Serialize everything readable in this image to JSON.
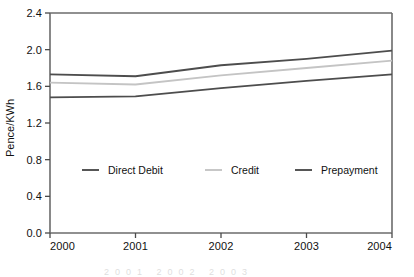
{
  "chart_data": {
    "type": "line",
    "title": "",
    "subtitle": "",
    "xlabel": "",
    "ylabel": "Pence/KWh",
    "x": [
      "2000",
      "2001",
      "2002",
      "2003",
      "2004"
    ],
    "categories": [
      "2000",
      "2001",
      "2002",
      "2003",
      "2004"
    ],
    "xlim": [
      2000,
      2004
    ],
    "ylim": [
      0.0,
      2.4
    ],
    "yticks": [
      "0.0",
      "0.4",
      "0.8",
      "1.2",
      "1.6",
      "2.0",
      "2.4"
    ],
    "ytick_values": [
      0.0,
      0.4,
      0.8,
      1.2,
      1.6,
      2.0,
      2.4
    ],
    "xticks": [
      "2000",
      "2001",
      "2002",
      "2003",
      "2004"
    ],
    "grid": false,
    "legend_position": "inside-lower-left",
    "series": [
      {
        "name": "Direct Debit",
        "color": "#4d4d4d",
        "values": [
          1.73,
          1.71,
          1.83,
          1.9,
          1.99
        ]
      },
      {
        "name": "Credit",
        "color": "#c4c4c4",
        "values": [
          1.64,
          1.62,
          1.72,
          1.8,
          1.88
        ]
      },
      {
        "name": "Prepayment",
        "color": "#4d4d4d",
        "values": [
          1.48,
          1.49,
          1.58,
          1.66,
          1.73
        ]
      }
    ]
  },
  "legend": {
    "entries": [
      {
        "label": "Direct Debit",
        "color": "#4d4d4d"
      },
      {
        "label": "Credit",
        "color": "#c4c4c4"
      },
      {
        "label": "Prepayment",
        "color": "#4d4d4d"
      }
    ]
  },
  "axes": {
    "y_title": "Pence/KWh",
    "y_labels": [
      "2.4",
      "2.0",
      "1.6",
      "1.2",
      "0.8",
      "0.4",
      "0.0"
    ],
    "x_labels": [
      "2000",
      "2001",
      "2002",
      "2003",
      "2004"
    ]
  },
  "colors": {
    "axis": "#6b6b6b",
    "dark_series": "#4d4d4d",
    "light_series": "#c4c4c4",
    "text": "#111111",
    "background": "#ffffff"
  },
  "footer_ghost": "2001   2002   2003"
}
